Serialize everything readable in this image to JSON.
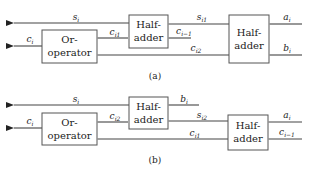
{
  "diagram_a": {
    "caption": "(a)",
    "blocks": {
      "or_operator": [
        "Or-",
        "operator"
      ],
      "half_adder_middle": [
        "Half-",
        "adder"
      ],
      "half_adder_right": [
        "Half-",
        "adder"
      ]
    },
    "signals": {
      "s_out": {
        "base": "s",
        "sub": "i"
      },
      "c_out": {
        "base": "c",
        "sub": "i"
      },
      "c_i1": {
        "base": "c",
        "sub": "i1"
      },
      "s_i1": {
        "base": "s",
        "sub": "i1"
      },
      "c_prev": {
        "base": "c",
        "sub": "i−1"
      },
      "c_i2": {
        "base": "c",
        "sub": "i2"
      },
      "a_in": {
        "base": "a",
        "sub": "i"
      },
      "b_in": {
        "base": "b",
        "sub": "i"
      }
    }
  },
  "diagram_b": {
    "caption": "(b)",
    "blocks": {
      "or_operator": [
        "Or-",
        "operator"
      ],
      "half_adder_middle": [
        "Half-",
        "adder"
      ],
      "half_adder_right": [
        "Half-",
        "adder"
      ]
    },
    "signals": {
      "s_out": {
        "base": "s",
        "sub": "i"
      },
      "c_out": {
        "base": "c",
        "sub": "i"
      },
      "c_i2": {
        "base": "c",
        "sub": "i2"
      },
      "b_in": {
        "base": "b",
        "sub": "i"
      },
      "s_i2": {
        "base": "s",
        "sub": "i2"
      },
      "c_i1": {
        "base": "c",
        "sub": "i1"
      },
      "a_in": {
        "base": "a",
        "sub": "i"
      },
      "c_prev": {
        "base": "c",
        "sub": "i−1"
      }
    }
  }
}
